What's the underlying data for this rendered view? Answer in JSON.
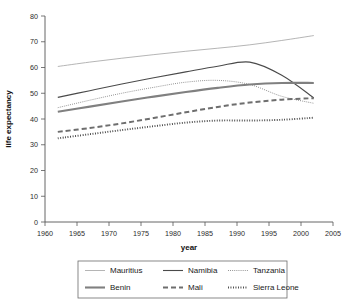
{
  "chart_data": {
    "type": "line",
    "title": "",
    "xlabel": "year",
    "ylabel": "life expectancy",
    "xlim": [
      1960,
      2005
    ],
    "ylim": [
      0,
      80
    ],
    "xticks": [
      1960,
      1965,
      1970,
      1975,
      1980,
      1985,
      1990,
      1995,
      2000,
      2005
    ],
    "yticks": [
      0,
      10,
      20,
      30,
      40,
      50,
      60,
      70,
      80
    ],
    "grid": false,
    "legend_position": "bottom",
    "x": [
      1962,
      1967,
      1972,
      1977,
      1982,
      1987,
      1992,
      1997,
      2002
    ],
    "series": [
      {
        "name": "Mauritius",
        "style": "thin-solid",
        "color": "#a8a8a8",
        "width": 0.85,
        "dash": "",
        "values": [
          60.4,
          62.1,
          63.6,
          65.0,
          66.3,
          67.5,
          68.8,
          70.5,
          72.4
        ]
      },
      {
        "name": "Namibia",
        "style": "medium-solid",
        "color": "#4a4a4a",
        "width": 1.1,
        "dash": "",
        "values": [
          48.4,
          51.0,
          53.6,
          56.0,
          58.3,
          60.5,
          62.1,
          57.0,
          48.2
        ]
      },
      {
        "name": "Tanzania",
        "style": "fine-dotted",
        "color": "#8a8a8a",
        "width": 1.0,
        "dash": "0.9 1.2",
        "values": [
          44.4,
          47.3,
          50.0,
          52.3,
          54.3,
          55.0,
          53.4,
          48.8,
          46.1
        ]
      },
      {
        "name": "Benin",
        "style": "thick-solid",
        "color": "#808080",
        "width": 2.1,
        "dash": "",
        "values": [
          42.8,
          44.8,
          46.8,
          48.7,
          50.5,
          52.1,
          53.4,
          54.0,
          54.0
        ]
      },
      {
        "name": "Mali",
        "style": "dashed",
        "color": "#6e6e6e",
        "width": 2.0,
        "dash": "5 3",
        "values": [
          35.0,
          36.5,
          38.3,
          40.4,
          42.6,
          44.7,
          46.4,
          47.5,
          48.1
        ]
      },
      {
        "name": "Sierra Leone",
        "style": "thick-dotted",
        "color": "#3d3d3d",
        "width": 1.9,
        "dash": "0.9 1.6",
        "values": [
          32.5,
          34.1,
          35.7,
          37.2,
          38.6,
          39.4,
          39.4,
          39.7,
          40.5
        ]
      }
    ]
  },
  "legend": {
    "entries": [
      {
        "label": "Mauritius"
      },
      {
        "label": "Namibia"
      },
      {
        "label": "Tanzania"
      },
      {
        "label": "Benin"
      },
      {
        "label": "Mali"
      },
      {
        "label": "Sierra Leone"
      }
    ]
  }
}
